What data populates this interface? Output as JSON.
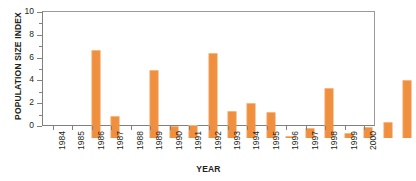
{
  "chart_data": {
    "type": "bar",
    "title": "",
    "xlabel": "YEAR",
    "ylabel": "POPULATION SIZE INDEX",
    "ylim": [
      0,
      10
    ],
    "yticks": [
      0,
      2,
      4,
      6,
      8,
      10
    ],
    "ytick_labels": [
      "0",
      "2",
      "4",
      "6",
      "8",
      "10"
    ],
    "yticks_minor": [
      1,
      3,
      5,
      7,
      9
    ],
    "grid": false,
    "legend": null,
    "bar_color": "#ef8f3c",
    "categories": [
      "1984",
      "1985",
      "1986",
      "1987",
      "1988",
      "1989",
      "1990",
      "1991",
      "1992",
      "1993",
      "1994",
      "1995",
      "1996",
      "1997",
      "1998",
      "1999",
      "2000"
    ],
    "values": [
      7.65,
      1.85,
      0,
      5.9,
      1.0,
      1.05,
      7.35,
      2.3,
      3.0,
      2.2,
      0.1,
      0.8,
      4.3,
      0.35,
      0.85,
      1.35,
      5.0
    ],
    "series": [
      {
        "name": "Population size index",
        "values": [
          7.65,
          1.85,
          0,
          5.9,
          1.0,
          1.05,
          7.35,
          2.3,
          3.0,
          2.2,
          0.1,
          0.8,
          4.3,
          0.35,
          0.85,
          1.35,
          5.0
        ]
      }
    ]
  }
}
